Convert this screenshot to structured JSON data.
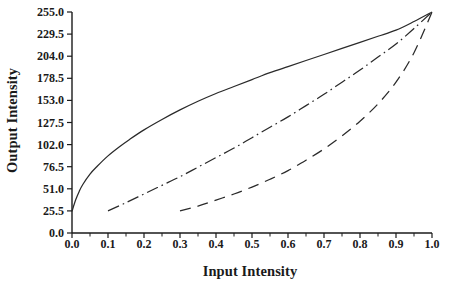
{
  "chart_data": {
    "type": "line",
    "title": "",
    "xlabel": "Input Intensity",
    "ylabel": "Output Intensity",
    "xlim": [
      0.0,
      1.0
    ],
    "ylim": [
      0.0,
      255.0
    ],
    "grid": false,
    "legend": "none",
    "x_ticks": [
      "0.0",
      "0.1",
      "0.2",
      "0.3",
      "0.4",
      "0.5",
      "0.6",
      "0.7",
      "0.8",
      "0.9",
      "1.0"
    ],
    "x_tick_values": [
      0.0,
      0.1,
      0.2,
      0.3,
      0.4,
      0.5,
      0.6,
      0.7,
      0.8,
      0.9,
      1.0
    ],
    "y_ticks": [
      "0.0",
      "25.5",
      "51.0",
      "76.5",
      "102.0",
      "127.5",
      "153.0",
      "178.5",
      "204.0",
      "229.5",
      "255.0"
    ],
    "y_tick_values": [
      0.0,
      25.5,
      51.0,
      76.5,
      102.0,
      127.5,
      153.0,
      178.5,
      204.0,
      229.5,
      255.0
    ],
    "series": [
      {
        "name": "curve-solid",
        "style": "solid",
        "color": "#2a2a2a",
        "x": [
          0.0,
          0.01,
          0.02,
          0.03,
          0.05,
          0.07,
          0.1,
          0.13,
          0.16,
          0.2,
          0.25,
          0.3,
          0.35,
          0.4,
          0.45,
          0.5,
          0.55,
          0.6,
          0.65,
          0.7,
          0.75,
          0.8,
          0.85,
          0.9,
          0.95,
          1.0
        ],
        "y": [
          25.0,
          38.0,
          48.0,
          56.0,
          68.0,
          77.0,
          89.0,
          99.0,
          108.0,
          119.0,
          131.0,
          142.0,
          152.0,
          161.0,
          169.0,
          177.0,
          185.0,
          192.0,
          199.0,
          206.0,
          213.0,
          220.0,
          227.0,
          234.0,
          244.0,
          255.0
        ]
      },
      {
        "name": "curve-dash-dot",
        "style": "dash-dot",
        "color": "#2a2a2a",
        "x": [
          0.1,
          0.15,
          0.2,
          0.25,
          0.3,
          0.35,
          0.4,
          0.45,
          0.5,
          0.55,
          0.6,
          0.65,
          0.7,
          0.75,
          0.8,
          0.85,
          0.9,
          0.95,
          1.0
        ],
        "y": [
          25.5,
          35.0,
          45.0,
          55.0,
          65.0,
          76.0,
          87.0,
          98.0,
          110.0,
          122.0,
          134.0,
          147.0,
          160.0,
          174.0,
          188.0,
          203.0,
          218.0,
          236.0,
          255.0
        ]
      },
      {
        "name": "curve-dashed",
        "style": "dashed",
        "color": "#2a2a2a",
        "x": [
          0.3,
          0.35,
          0.4,
          0.45,
          0.5,
          0.55,
          0.6,
          0.65,
          0.7,
          0.75,
          0.8,
          0.85,
          0.9,
          0.95,
          1.0
        ],
        "y": [
          25.5,
          31.0,
          38.0,
          45.0,
          53.0,
          62.0,
          72.0,
          84.0,
          97.0,
          112.0,
          129.0,
          149.0,
          174.0,
          208.0,
          255.0
        ]
      }
    ]
  }
}
